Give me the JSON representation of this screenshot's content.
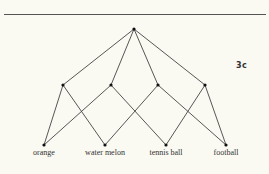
{
  "figure": {
    "label": "3c",
    "root": {
      "x": 134,
      "y": 29
    },
    "middle_nodes": [
      {
        "x": 63,
        "y": 85
      },
      {
        "x": 111,
        "y": 85
      },
      {
        "x": 158,
        "y": 85
      },
      {
        "x": 205,
        "y": 85
      }
    ],
    "leaves": [
      {
        "x": 44,
        "y": 145,
        "label": "orange"
      },
      {
        "x": 105,
        "y": 145,
        "label": "water melon"
      },
      {
        "x": 166,
        "y": 145,
        "label": "tennis ball"
      },
      {
        "x": 226,
        "y": 145,
        "label": "football"
      }
    ],
    "edges_root_to_middle": [
      0,
      1,
      2,
      3
    ],
    "edges_middle_to_leaf": [
      [
        0,
        0
      ],
      [
        0,
        1
      ],
      [
        1,
        0
      ],
      [
        1,
        2
      ],
      [
        2,
        1
      ],
      [
        2,
        3
      ],
      [
        3,
        2
      ],
      [
        3,
        3
      ]
    ],
    "colors": {
      "line": "#444444",
      "node": "#111111",
      "background": "#faf9f2"
    }
  }
}
